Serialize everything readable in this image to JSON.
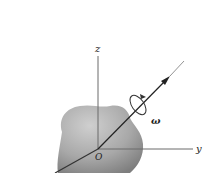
{
  "diagram": {
    "type": "rigid-body-rotation",
    "axes": {
      "z_label": "z",
      "y_label": "y",
      "origin_label": "O"
    },
    "rotation": {
      "symbol": "ω"
    },
    "colors": {
      "axis": "#666666",
      "body_light": "#c4c4c4",
      "body_dark": "#8a8a8a",
      "vector": "#222222",
      "label": "#222222"
    }
  }
}
